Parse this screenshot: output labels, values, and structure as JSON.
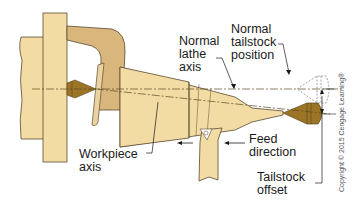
{
  "diagram": {
    "labels": {
      "normal_lathe_axis": "Normal\nlathe\naxis",
      "normal_tailstock_position": "Normal\ntailstock\nposition",
      "workpiece_axis": "Workpiece\naxis",
      "feed_direction": "Feed\ndirection",
      "tailstock_offset": "Tailstock\noffset"
    },
    "copyright": "Copyright © 2015 Cengage Learning®",
    "components": [
      "headstock",
      "faceplate",
      "lathe-dog",
      "headstock-center",
      "tapered-workpiece",
      "cutting-tool",
      "tailstock-center-offset",
      "tailstock-center-normal-ghost"
    ],
    "colors": {
      "light_wood": "#f3dca4",
      "mid_wood": "#e6c98a",
      "dog_tan": "#d9b77c",
      "center_bronze": "#9c7425",
      "center_dark": "#7a5a18",
      "outline": "#5a4a30",
      "axis_line": "#5a4a20",
      "text": "#1a1a1a"
    }
  }
}
